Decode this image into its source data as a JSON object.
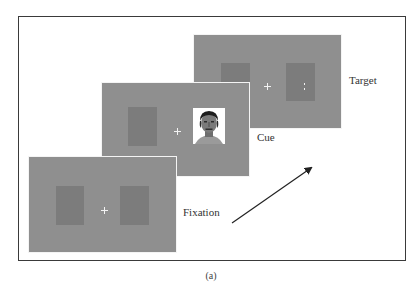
{
  "figure": {
    "caption": "(a)",
    "colors": {
      "panel": "#8f8f8f",
      "placeholder_rect": "#7c7c7c",
      "fixation_cross": "#f2f2f2",
      "frame_border": "#3a3a3a",
      "arrow": "#222222"
    },
    "arrow": {
      "direction": "time-progression",
      "icon": "arrow-up-right-icon"
    },
    "panels": [
      {
        "id": "fixation",
        "label": "Fixation",
        "contents": [
          "left-placeholder",
          "fixation-cross",
          "right-placeholder"
        ]
      },
      {
        "id": "cue",
        "label": "Cue",
        "contents": [
          "left-placeholder",
          "fixation-cross",
          "face-image-right"
        ]
      },
      {
        "id": "target",
        "label": "Target",
        "contents": [
          "left-placeholder",
          "fixation-cross",
          "right-placeholder-with-target-dots"
        ],
        "target_glyph": ":"
      }
    ]
  }
}
